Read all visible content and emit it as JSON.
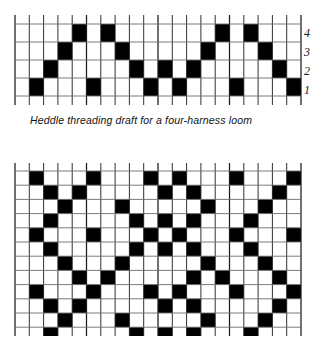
{
  "figure": {
    "title": "Heddle threading draft for a four-harness loom",
    "caption": "Heddle threading draft for a four-harness loom"
  },
  "colors": {
    "filled_cell": "#000000",
    "empty_cell": "#ffffff",
    "grid_line": "#6b6b6b",
    "grid_line_strong": "#1a1a1a",
    "text": "#111111",
    "background": "#ffffff"
  },
  "threading_draft": {
    "name": "heddle-threading-draft",
    "columns": 20,
    "rows": 4,
    "cell_width": 14.3,
    "cell_height": 18,
    "row_labels": [
      "4",
      "3",
      "2",
      "1"
    ],
    "row_label_order": "top-to-bottom",
    "description": "Point twill threading: harness sequence rising and falling across 20 warp ends",
    "filled_cells": [
      {
        "row_label": "4",
        "columns": [
          5,
          7,
          15,
          17
        ]
      },
      {
        "row_label": "3",
        "columns": [
          4,
          8,
          14,
          18
        ]
      },
      {
        "row_label": "2",
        "columns": [
          3,
          9,
          11,
          13,
          19
        ]
      },
      {
        "row_label": "1",
        "columns": [
          2,
          6,
          10,
          12,
          16,
          20
        ]
      }
    ],
    "threading_sequence": [
      1,
      2,
      3,
      4,
      1,
      4,
      3,
      2,
      1,
      2,
      1,
      2,
      3,
      4,
      1,
      4,
      3,
      2,
      1,
      2
    ]
  },
  "drawdown": {
    "name": "fabric-drawdown",
    "columns": 20,
    "rows": 12,
    "cell_width": 14.3,
    "cell_height": 14.2,
    "description": "Interlacement drawdown showing the diamond twill cloth produced by the threading draft",
    "filled_cells": [
      {
        "row": 1,
        "columns": [
          2,
          6,
          10,
          12,
          16,
          20
        ]
      },
      {
        "row": 2,
        "columns": [
          3,
          5,
          11,
          13,
          19
        ]
      },
      {
        "row": 3,
        "columns": [
          4,
          8,
          14,
          18
        ]
      },
      {
        "row": 4,
        "columns": [
          3,
          9,
          11,
          13,
          17
        ]
      },
      {
        "row": 5,
        "columns": [
          2,
          6,
          10,
          12,
          16,
          20
        ]
      },
      {
        "row": 6,
        "columns": [
          3,
          9,
          11,
          13,
          17
        ]
      },
      {
        "row": 7,
        "columns": [
          4,
          8,
          14,
          18
        ]
      },
      {
        "row": 8,
        "columns": [
          5,
          7,
          13,
          15,
          19
        ]
      },
      {
        "row": 9,
        "columns": [
          2,
          6,
          10,
          12,
          16,
          20
        ]
      },
      {
        "row": 10,
        "columns": [
          3,
          5,
          11,
          13,
          19
        ]
      },
      {
        "row": 11,
        "columns": [
          4,
          8,
          14,
          18
        ]
      },
      {
        "row": 12,
        "columns": [
          3,
          9,
          11,
          13,
          17
        ]
      }
    ]
  },
  "chart_data": {
    "type": "heatmap",
    "title": "Heddle threading draft for a four-harness loom",
    "xlabel": "",
    "ylabel": "",
    "legend": [],
    "grid": true,
    "panels": [
      {
        "name": "threading-draft",
        "type": "heatmap",
        "x": [
          1,
          2,
          3,
          4,
          5,
          6,
          7,
          8,
          9,
          10,
          11,
          12,
          13,
          14,
          15,
          16,
          17,
          18,
          19,
          20
        ],
        "ytick_labels": [
          "4",
          "3",
          "2",
          "1"
        ],
        "values": [
          [
            0,
            0,
            0,
            0,
            1,
            0,
            1,
            0,
            0,
            0,
            0,
            0,
            0,
            0,
            1,
            0,
            1,
            0,
            0,
            0
          ],
          [
            0,
            0,
            0,
            1,
            0,
            0,
            0,
            1,
            0,
            0,
            0,
            0,
            0,
            1,
            0,
            0,
            0,
            1,
            0,
            0
          ],
          [
            0,
            0,
            1,
            0,
            0,
            0,
            0,
            0,
            1,
            0,
            1,
            0,
            1,
            0,
            0,
            0,
            0,
            0,
            1,
            0
          ],
          [
            0,
            1,
            0,
            0,
            0,
            1,
            0,
            0,
            0,
            1,
            0,
            1,
            0,
            0,
            0,
            1,
            0,
            0,
            0,
            1
          ]
        ]
      },
      {
        "name": "drawdown",
        "type": "heatmap",
        "x": [
          1,
          2,
          3,
          4,
          5,
          6,
          7,
          8,
          9,
          10,
          11,
          12,
          13,
          14,
          15,
          16,
          17,
          18,
          19,
          20
        ],
        "ytick_labels": [],
        "values": [
          [
            0,
            1,
            0,
            0,
            0,
            1,
            0,
            0,
            0,
            1,
            0,
            1,
            0,
            0,
            0,
            1,
            0,
            0,
            0,
            1
          ],
          [
            0,
            0,
            1,
            0,
            1,
            0,
            0,
            0,
            0,
            0,
            1,
            0,
            1,
            0,
            0,
            0,
            0,
            0,
            1,
            0
          ],
          [
            0,
            0,
            0,
            1,
            0,
            0,
            0,
            1,
            0,
            0,
            0,
            0,
            0,
            1,
            0,
            0,
            0,
            1,
            0,
            0
          ],
          [
            0,
            0,
            1,
            0,
            0,
            0,
            0,
            0,
            1,
            0,
            1,
            0,
            1,
            0,
            0,
            0,
            1,
            0,
            0,
            0
          ],
          [
            0,
            1,
            0,
            0,
            0,
            1,
            0,
            0,
            0,
            1,
            0,
            1,
            0,
            0,
            0,
            1,
            0,
            0,
            0,
            1
          ],
          [
            0,
            0,
            1,
            0,
            0,
            0,
            0,
            0,
            1,
            0,
            1,
            0,
            1,
            0,
            0,
            0,
            1,
            0,
            0,
            0
          ],
          [
            0,
            0,
            0,
            1,
            0,
            0,
            0,
            1,
            0,
            0,
            0,
            0,
            0,
            1,
            0,
            0,
            0,
            1,
            0,
            0
          ],
          [
            0,
            0,
            0,
            0,
            1,
            0,
            1,
            0,
            0,
            0,
            0,
            0,
            1,
            0,
            1,
            0,
            0,
            0,
            1,
            0
          ],
          [
            0,
            1,
            0,
            0,
            0,
            1,
            0,
            0,
            0,
            1,
            0,
            1,
            0,
            0,
            0,
            1,
            0,
            0,
            0,
            1
          ],
          [
            0,
            0,
            1,
            0,
            1,
            0,
            0,
            0,
            0,
            0,
            1,
            0,
            1,
            0,
            0,
            0,
            0,
            0,
            1,
            0
          ],
          [
            0,
            0,
            0,
            1,
            0,
            0,
            0,
            1,
            0,
            0,
            0,
            0,
            0,
            1,
            0,
            0,
            0,
            1,
            0,
            0
          ],
          [
            0,
            0,
            1,
            0,
            0,
            0,
            0,
            0,
            1,
            0,
            1,
            0,
            1,
            0,
            0,
            0,
            1,
            0,
            0,
            0
          ]
        ]
      }
    ]
  }
}
